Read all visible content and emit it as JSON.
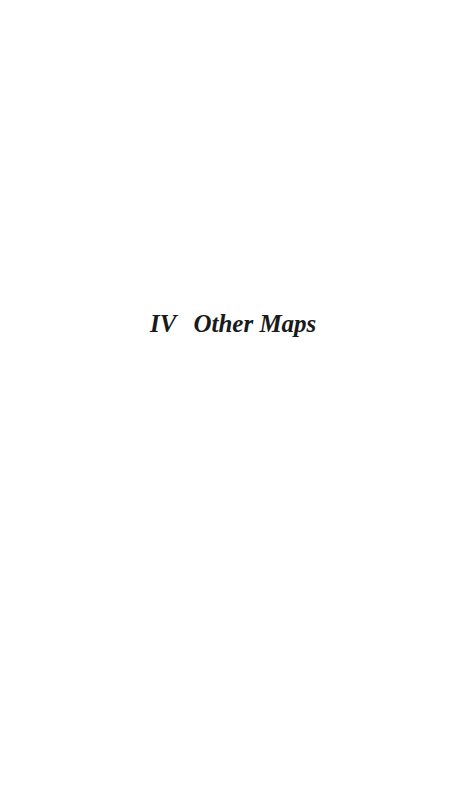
{
  "page": {
    "part_heading": {
      "number": "IV",
      "title": "Other Maps"
    }
  }
}
